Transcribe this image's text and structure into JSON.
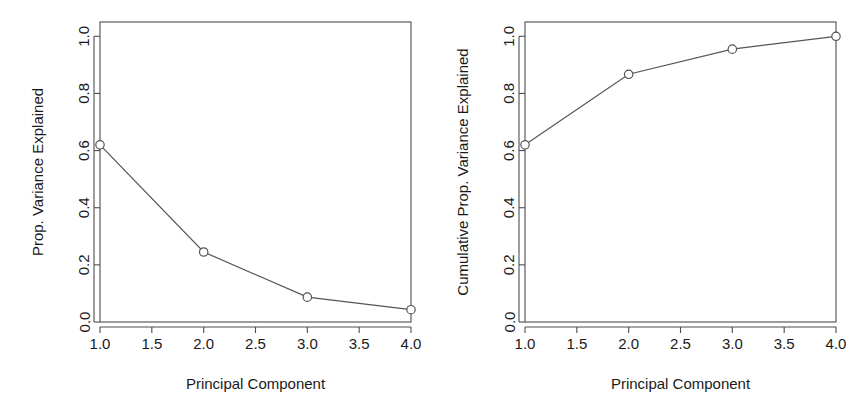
{
  "figure": {
    "background": "#ffffff",
    "line_color": "#555555",
    "axis_color": "#4d4d4d",
    "marker_fill": "#ffffff",
    "marker_edge": "#555555"
  },
  "chart_data": [
    {
      "type": "line",
      "panel": "left",
      "title": "",
      "xlabel": "Principal Component",
      "ylabel": "Prop. Variance Explained",
      "x": [
        1,
        2,
        3,
        4
      ],
      "values": [
        0.62,
        0.245,
        0.087,
        0.043
      ],
      "xlim": [
        1.0,
        4.0
      ],
      "ylim": [
        0.0,
        1.05
      ],
      "xticks": [
        1.0,
        1.5,
        2.0,
        2.5,
        3.0,
        3.5,
        4.0
      ],
      "xticklabels": [
        "1.0",
        "1.5",
        "2.0",
        "2.5",
        "3.0",
        "3.5",
        "4.0"
      ],
      "yticks": [
        0.0,
        0.2,
        0.4,
        0.6,
        0.8,
        1.0
      ],
      "yticklabels": [
        "0.0",
        "0.2",
        "0.4",
        "0.6",
        "0.8",
        "1.0"
      ],
      "grid": false,
      "legend": "none",
      "marker": "open-circle"
    },
    {
      "type": "line",
      "panel": "right",
      "title": "",
      "xlabel": "Principal Component",
      "ylabel": "Cumulative Prop. Variance Explained",
      "x": [
        1,
        2,
        3,
        4
      ],
      "values": [
        0.62,
        0.867,
        0.955,
        1.0
      ],
      "xlim": [
        1.0,
        4.0
      ],
      "ylim": [
        0.0,
        1.05
      ],
      "xticks": [
        1.0,
        1.5,
        2.0,
        2.5,
        3.0,
        3.5,
        4.0
      ],
      "xticklabels": [
        "1.0",
        "1.5",
        "2.0",
        "2.5",
        "3.0",
        "3.5",
        "4.0"
      ],
      "yticks": [
        0.0,
        0.2,
        0.4,
        0.6,
        0.8,
        1.0
      ],
      "yticklabels": [
        "0.0",
        "0.2",
        "0.4",
        "0.6",
        "0.8",
        "1.0"
      ],
      "grid": false,
      "legend": "none",
      "marker": "open-circle"
    }
  ]
}
